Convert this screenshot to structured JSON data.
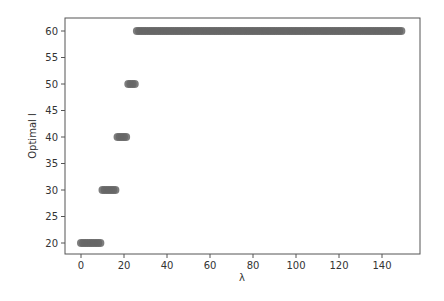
{
  "chart_data": {
    "type": "scatter",
    "title": "",
    "xlabel": "λ",
    "ylabel": "Optimal l",
    "xlim": [
      -4,
      155
    ],
    "ylim": [
      18,
      62
    ],
    "grid": false,
    "legend": null,
    "x_ticks": [
      0,
      20,
      40,
      60,
      80,
      100,
      120,
      140
    ],
    "y_ticks": [
      20,
      25,
      30,
      35,
      40,
      45,
      50,
      55,
      60
    ],
    "marker_color": "#666666",
    "series": [
      {
        "name": "optimal_l",
        "segments": [
          {
            "y": 20,
            "x_start": 0,
            "x_end": 9
          },
          {
            "y": 30,
            "x_start": 10,
            "x_end": 16
          },
          {
            "y": 40,
            "x_start": 17,
            "x_end": 21
          },
          {
            "y": 50,
            "x_start": 22,
            "x_end": 25
          },
          {
            "y": 60,
            "x_start": 26,
            "x_end": 149
          }
        ]
      }
    ]
  }
}
